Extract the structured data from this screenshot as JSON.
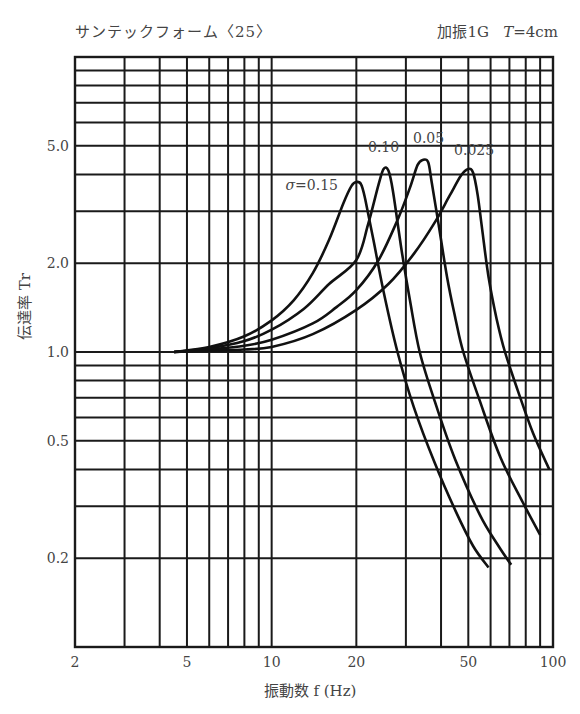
{
  "header": {
    "title_left": "サンテックフォーム〈25〉",
    "title_right_prefix": "加振1G",
    "title_right_var": "T",
    "title_right_suffix": "=4cm"
  },
  "axes": {
    "xlabel": "振動数 f (Hz)",
    "ylabel": "伝達率 Tr"
  },
  "chart_data": {
    "type": "line",
    "xlabel": "振動数 f (Hz)",
    "ylabel": "伝達率 Tr",
    "xscale": "log",
    "yscale": "log",
    "xlim": [
      2,
      100
    ],
    "ylim": [
      0.1,
      10
    ],
    "grid": true,
    "x_ticks": [
      2,
      5,
      10,
      20,
      50,
      100
    ],
    "x_tick_labels": [
      "2",
      "5",
      "10",
      "20",
      "50",
      "100"
    ],
    "y_ticks": [
      0.2,
      0.5,
      1.0,
      2.0,
      5.0
    ],
    "y_tick_labels": [
      "0.2",
      "0.5",
      "1.0",
      "2.0",
      "5.0"
    ],
    "x_gridlines": [
      2,
      3,
      4,
      5,
      6,
      7,
      8,
      9,
      10,
      20,
      30,
      40,
      50,
      60,
      70,
      80,
      90,
      100
    ],
    "y_gridlines": [
      0.1,
      0.2,
      0.3,
      0.4,
      0.5,
      0.6,
      0.7,
      0.8,
      0.9,
      1,
      2,
      3,
      4,
      5,
      6,
      7,
      8,
      9,
      10
    ],
    "annotations": [
      {
        "text": "σ=0.15",
        "f": 11.2,
        "tr": 3.55
      },
      {
        "text": "0.10",
        "f": 22.0,
        "tr": 4.75
      },
      {
        "text": "0.05",
        "f": 31.8,
        "tr": 5.1
      },
      {
        "text": "0.025",
        "f": 44.5,
        "tr": 4.65
      }
    ],
    "series": [
      {
        "name": "σ=0.15",
        "points": [
          [
            4.5,
            1.0
          ],
          [
            6,
            1.04
          ],
          [
            8,
            1.13
          ],
          [
            10,
            1.28
          ],
          [
            12,
            1.5
          ],
          [
            14,
            1.85
          ],
          [
            16,
            2.4
          ],
          [
            18,
            3.2
          ],
          [
            19.2,
            3.65
          ],
          [
            20,
            3.77
          ],
          [
            20.8,
            3.7
          ],
          [
            21.5,
            3.3
          ],
          [
            23,
            2.4
          ],
          [
            25,
            1.6
          ],
          [
            28,
            1.0
          ],
          [
            32,
            0.65
          ],
          [
            38,
            0.42
          ],
          [
            45,
            0.29
          ],
          [
            52,
            0.22
          ],
          [
            59,
            0.186
          ]
        ]
      },
      {
        "name": "σ=0.10",
        "points": [
          [
            4.5,
            1.0
          ],
          [
            6,
            1.03
          ],
          [
            8,
            1.09
          ],
          [
            10,
            1.19
          ],
          [
            13,
            1.4
          ],
          [
            16,
            1.7
          ],
          [
            20,
            2.05
          ],
          [
            22,
            2.7
          ],
          [
            24,
            3.7
          ],
          [
            25,
            4.17
          ],
          [
            26,
            4.12
          ],
          [
            27,
            3.5
          ],
          [
            29,
            2.2
          ],
          [
            31,
            1.5
          ],
          [
            33.6,
            1.0
          ],
          [
            38,
            0.68
          ],
          [
            45,
            0.43
          ],
          [
            55,
            0.28
          ],
          [
            64,
            0.22
          ],
          [
            71,
            0.19
          ]
        ]
      },
      {
        "name": "σ=0.05",
        "points": [
          [
            4.5,
            1.0
          ],
          [
            6,
            1.02
          ],
          [
            8,
            1.05
          ],
          [
            10,
            1.1
          ],
          [
            14,
            1.25
          ],
          [
            17,
            1.42
          ],
          [
            20,
            1.62
          ],
          [
            24,
            2.05
          ],
          [
            28,
            2.8
          ],
          [
            31,
            3.6
          ],
          [
            33,
            4.3
          ],
          [
            34.5,
            4.48
          ],
          [
            36,
            4.4
          ],
          [
            37,
            3.8
          ],
          [
            39,
            2.8
          ],
          [
            42,
            1.8
          ],
          [
            45,
            1.3
          ],
          [
            48,
            1.0
          ],
          [
            55,
            0.68
          ],
          [
            65,
            0.44
          ],
          [
            78,
            0.31
          ],
          [
            90,
            0.24
          ]
        ]
      },
      {
        "name": "σ=0.025",
        "points": [
          [
            4.5,
            1.0
          ],
          [
            6,
            1.01
          ],
          [
            8,
            1.02
          ],
          [
            10,
            1.04
          ],
          [
            14,
            1.15
          ],
          [
            20,
            1.39
          ],
          [
            26,
            1.7
          ],
          [
            32,
            2.15
          ],
          [
            38,
            2.75
          ],
          [
            43,
            3.4
          ],
          [
            47,
            3.95
          ],
          [
            50,
            4.17
          ],
          [
            52,
            4.05
          ],
          [
            54,
            3.4
          ],
          [
            56,
            2.6
          ],
          [
            59,
            1.8
          ],
          [
            63,
            1.3
          ],
          [
            67.5,
            1.0
          ],
          [
            75,
            0.74
          ],
          [
            85,
            0.53
          ],
          [
            97,
            0.4
          ]
        ]
      }
    ]
  }
}
